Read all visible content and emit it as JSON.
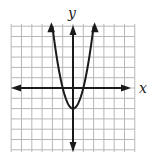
{
  "chart_data": {
    "type": "line",
    "title": "",
    "xlabel": "x",
    "ylabel": "y",
    "function": "y = 2x^2 - 2 (estimated)",
    "vertex": [
      0,
      -2
    ],
    "x_intercepts": [
      -1,
      1
    ],
    "xlim": [
      -6,
      6
    ],
    "ylim": [
      -6,
      6
    ],
    "grid": true,
    "grid_step": 1,
    "x": [
      -2,
      -1.5,
      -1,
      -0.5,
      0,
      0.5,
      1,
      1.5,
      2
    ],
    "y": [
      6,
      2.5,
      0,
      -1.5,
      -2,
      -1.5,
      0,
      2.5,
      6
    ],
    "colors": {
      "grid": "#b8b8b8",
      "axis": "#1a1a1a",
      "curve": "#1a1a1a"
    }
  },
  "labels": {
    "x_axis": "x",
    "y_axis": "y"
  }
}
